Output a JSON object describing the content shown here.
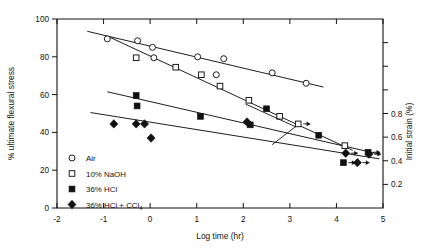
{
  "chart_data": {
    "type": "scatter",
    "title": "",
    "xlabel": "Log time (hr)",
    "ylabel": "% ultimate flexural stress",
    "y2label": "Initial strain (%)",
    "xlim": [
      -2,
      5
    ],
    "ylim": [
      0,
      100
    ],
    "y2lim": [
      0.0,
      1.6
    ],
    "grid": false,
    "legend_position": "lower-left inside axes",
    "xticks": [
      -2,
      -1,
      0,
      1,
      2,
      3,
      4,
      5
    ],
    "xticklabels": [
      "-2",
      "-1",
      "0",
      "1",
      "2",
      "3",
      "4",
      "5"
    ],
    "yticks": [
      0,
      20,
      40,
      60,
      80,
      100
    ],
    "yticklabels": [
      "0",
      "20",
      "40",
      "60",
      "80",
      "100"
    ],
    "y2ticks": [
      0.2,
      0.4,
      0.6,
      0.8,
      1.0,
      1.2,
      1.4
    ],
    "y2ticklabels": [
      "0.2",
      "0.4",
      "0.6",
      "0.8",
      "",
      "",
      ""
    ],
    "series": [
      {
        "name": "Air",
        "marker": "open-circle",
        "points": [
          {
            "x": -0.92,
            "y": 89.5
          },
          {
            "x": -0.27,
            "y": 88.5
          },
          {
            "x": 0.05,
            "y": 85.0
          },
          {
            "x": 0.08,
            "y": 79.5
          },
          {
            "x": 1.02,
            "y": 80.0
          },
          {
            "x": 1.42,
            "y": 70.5
          },
          {
            "x": 1.58,
            "y": 79.0
          },
          {
            "x": 2.62,
            "y": 71.5
          },
          {
            "x": 3.35,
            "y": 66.0
          }
        ],
        "fit": {
          "x1": -1.35,
          "y1": 93.5,
          "x2": 3.72,
          "y2": 64.0
        }
      },
      {
        "name": "10% NaOH",
        "marker": "open-square",
        "points": [
          {
            "x": -0.3,
            "y": 79.5
          },
          {
            "x": 0.55,
            "y": 74.5
          },
          {
            "x": 1.1,
            "y": 70.5
          },
          {
            "x": 1.5,
            "y": 64.5
          },
          {
            "x": 2.12,
            "y": 57.0
          },
          {
            "x": 2.78,
            "y": 48.5
          },
          {
            "x": 3.18,
            "y": 44.5,
            "arrow": true
          },
          {
            "x": 4.18,
            "y": 33.0
          }
        ],
        "fit": {
          "x1": -0.88,
          "y1": 90.5,
          "x2": 4.35,
          "y2": 30.5
        }
      },
      {
        "name": "36% HCl",
        "marker": "filled-square",
        "points": [
          {
            "x": -0.3,
            "y": 59.5
          },
          {
            "x": -0.28,
            "y": 54.0
          },
          {
            "x": 1.08,
            "y": 48.5
          },
          {
            "x": 2.15,
            "y": 44.0
          },
          {
            "x": 2.5,
            "y": 52.5
          },
          {
            "x": 3.62,
            "y": 38.5
          },
          {
            "x": 4.15,
            "y": 24.0,
            "arrow": true
          },
          {
            "x": 4.68,
            "y": 29.5,
            "arrow": true
          }
        ],
        "fit": {
          "x1": -0.92,
          "y1": 61.5,
          "x2": 4.92,
          "y2": 28.5
        }
      },
      {
        "name": "36% HCl + CCl₄",
        "marker": "filled-diamond",
        "points": [
          {
            "x": -0.78,
            "y": 44.5
          },
          {
            "x": -0.3,
            "y": 44.5
          },
          {
            "x": -0.12,
            "y": 44.5
          },
          {
            "x": 0.02,
            "y": 37.0
          },
          {
            "x": 2.08,
            "y": 45.5
          },
          {
            "x": 4.2,
            "y": 29.0,
            "arrow": true
          },
          {
            "x": 4.45,
            "y": 24.0,
            "arrow": true
          },
          {
            "x": 4.7,
            "y": 28.5,
            "arrow": true
          }
        ],
        "fit": {
          "x1": -1.28,
          "y1": 50.5,
          "x2": 4.92,
          "y2": 26.0
        }
      }
    ]
  },
  "legend": {
    "items": [
      {
        "label": "Air",
        "marker": "open-circle"
      },
      {
        "label": "10% NaOH",
        "marker": "open-square"
      },
      {
        "label": "36% HCl",
        "marker": "filled-square"
      },
      {
        "label": "36% HCl + CCl",
        "sub": "4",
        "marker": "filled-diamond"
      }
    ]
  },
  "axes": {
    "x_title": "Log time (hr)",
    "y_title": "% ultimate flexural stress",
    "y2_title": "Initial strain (%)"
  }
}
